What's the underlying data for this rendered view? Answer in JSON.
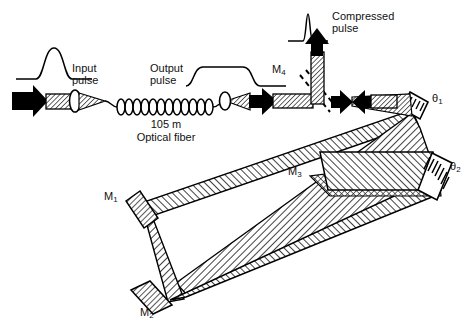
{
  "figure": {
    "type": "optical-schematic"
  },
  "labels": {
    "input_pulse": "Input\npulse",
    "output_pulse": "Output\npulse",
    "compressed_pulse": "Compressed\npulse",
    "fiber_length": "105 m",
    "fiber_name": "Optical fiber",
    "mirror_1": "M",
    "mirror_1_sub": "1",
    "mirror_2": "M",
    "mirror_2_sub": "2",
    "mirror_3": "M",
    "mirror_3_sub": "3",
    "mirror_4": "M",
    "mirror_4_sub": "4",
    "theta_1": "θ",
    "theta_1_sub": "1",
    "theta_2": "θ",
    "theta_2_sub": "2"
  },
  "components": {
    "lens_1": "input-coupling-lens",
    "lens_2": "output-collimating-lens",
    "fiber": "coiled-single-mode-fiber",
    "grating_1": "diffraction-grating-theta1",
    "grating_2": "diffraction-grating-theta2",
    "mirror_m1": "fold-mirror-m1",
    "mirror_m2": "fold-mirror-m2",
    "mirror_m3": "pickoff-mirror-m3",
    "mirror_m4": "output-pickoff-mirror-m4"
  },
  "waveforms": {
    "input": {
      "shape": "gaussian",
      "description": "short smooth bell-shaped pulse"
    },
    "output": {
      "shape": "flat-top",
      "description": "broadened chirped square pulse"
    },
    "compressed": {
      "shape": "narrow-spike",
      "description": "very narrow tall spike"
    }
  },
  "colors": {
    "ink": "#000000",
    "beam_fill": "#ffffff",
    "hatch": "#1a1a1a",
    "background": "#ffffff"
  }
}
